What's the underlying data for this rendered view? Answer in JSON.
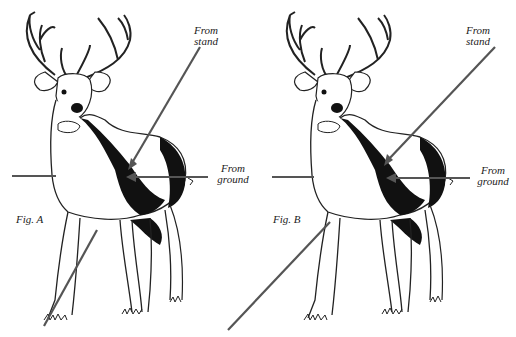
{
  "figures": [
    {
      "id": "A",
      "caption": "Fig. A",
      "labels": {
        "stand_line1": "From",
        "stand_line2": "stand",
        "ground_line1": "From",
        "ground_line2": "ground"
      }
    },
    {
      "id": "B",
      "caption": "Fig. B",
      "labels": {
        "stand_line1": "From",
        "stand_line2": "stand",
        "ground_line1": "From",
        "ground_line2": "ground"
      }
    }
  ],
  "colors": {
    "line": "#555555",
    "ink": "#111111",
    "background": "#ffffff"
  }
}
